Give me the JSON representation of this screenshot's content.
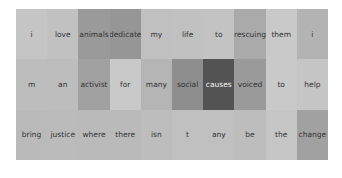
{
  "chart_data": {
    "type": "heatmap",
    "title": "",
    "rows": [
      {
        "tokens": [
          "i",
          "love",
          "animals",
          "dedicate",
          "my",
          "life",
          "to",
          "rescuing",
          "them",
          "i"
        ],
        "weights": [
          0.15,
          0.17,
          0.42,
          0.45,
          0.18,
          0.17,
          0.16,
          0.32,
          0.12,
          0.26
        ]
      },
      {
        "tokens": [
          "m",
          "an",
          "activist",
          "for",
          "many",
          "social",
          "causes",
          "voiced",
          "to",
          "help"
        ],
        "weights": [
          0.2,
          0.2,
          0.38,
          0.12,
          0.25,
          0.5,
          0.88,
          0.42,
          0.12,
          0.15
        ]
      },
      {
        "tokens": [
          "bring",
          "justice",
          "where",
          "there",
          "isn",
          "t",
          "any",
          "be",
          "the",
          "change"
        ],
        "weights": [
          0.22,
          0.21,
          0.22,
          0.22,
          0.2,
          0.18,
          0.18,
          0.2,
          0.14,
          0.38
        ]
      }
    ],
    "colors": {
      "low": "#dcdcdc",
      "high": "#404040"
    },
    "grid": false,
    "legend": "none"
  }
}
